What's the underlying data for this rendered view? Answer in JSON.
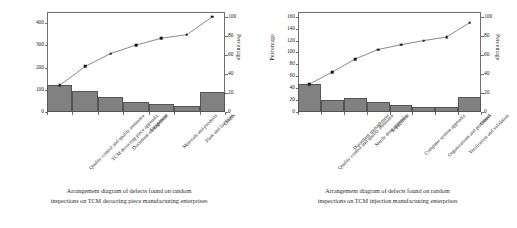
{
  "figure": {
    "panels": [
      {
        "id": "tcm-decocting-piece",
        "caption_line1": "Arrangement diagram of defects found on random",
        "caption_line2": "inspections on TCM decocting piece manufacturing enterprises",
        "right_axis_title": "Percentage",
        "chart_data": {
          "type": "bar",
          "title": "",
          "subtitle": "",
          "xlabel": "",
          "ylabel": "",
          "y2label": "Percentage",
          "grid": false,
          "legend": "none",
          "categories": [
            "Quality control and quality assurance",
            "TCM decocting piece appendix",
            "Document management",
            "Equipment",
            "Materials and products",
            "Plant and facilities",
            "Others"
          ],
          "series": [
            {
              "name": "Defect count",
              "type": "bar",
              "values": [
                120,
                95,
                68,
                45,
                38,
                25,
                88
              ]
            },
            {
              "name": "Cumulative percentage",
              "type": "line",
              "values": [
                120,
                205,
                263,
                301,
                332,
                348,
                428
              ]
            }
          ],
          "ylim": [
            0,
            450
          ],
          "yticks": [
            0,
            100,
            200,
            300,
            400
          ],
          "ytick_labels": [
            "0",
            "100",
            "200",
            "300",
            "400"
          ],
          "y2lim": [
            0,
            105
          ],
          "y2ticks": [
            0,
            20,
            40,
            60,
            80,
            100
          ],
          "y2tick_labels": [
            "0",
            "20",
            "40",
            "60",
            "80",
            "100"
          ],
          "cumulative_percent": [
            28.0,
            47.9,
            61.4,
            70.3,
            77.6,
            81.3,
            100.0
          ]
        }
      },
      {
        "id": "tcm-injection",
        "caption_line1": "Arrangement diagram of defects found on random",
        "caption_line2": "inspections on TCM injection manufacturing enterprises",
        "left_axis_title": "Percentage",
        "right_axis_title": "Percentage",
        "chart_data": {
          "type": "bar",
          "title": "",
          "subtitle": "",
          "xlabel": "",
          "ylabel": "Percentage",
          "y2label": "Percentage",
          "grid": false,
          "legend": "none",
          "categories": [
            "Quality control and quality assurance",
            "Document management",
            "Sterile drug appendix",
            "Equipment",
            "Computer system appendix",
            "Organizations and personnel",
            "Verification and validation",
            "Others"
          ],
          "series": [
            {
              "name": "Defect count",
              "type": "bar",
              "values": [
                47,
                21,
                23,
                17,
                11,
                9,
                9,
                26
              ]
            },
            {
              "name": "Cumulative percentage",
              "type": "line",
              "values": [
                47,
                67,
                89,
                105,
                113,
                120,
                126,
                150
              ]
            }
          ],
          "ylim": [
            0,
            168
          ],
          "yticks": [
            0,
            20,
            40,
            60,
            80,
            100,
            120,
            140,
            160
          ],
          "ytick_labels": [
            "0",
            "20",
            "40",
            "60",
            "80",
            "100",
            "120",
            "140",
            "160"
          ],
          "y2lim": [
            0,
            105
          ],
          "y2ticks": [
            0,
            20,
            40,
            60,
            80,
            100
          ],
          "y2tick_labels": [
            "0",
            "20",
            "40",
            "60",
            "80",
            "100"
          ],
          "cumulative_percent": [
            31.3,
            44.7,
            59.3,
            70.0,
            75.3,
            80.0,
            84.0,
            100.0
          ]
        }
      }
    ]
  },
  "colors": {
    "bar_fill": "#818181",
    "bar_stroke": "#555555",
    "line_stroke": "#3a3a3a",
    "marker_fill": "#1a1a1a",
    "frame": "#6e6e6e",
    "text": "#2b2b2b",
    "background": "#ffffff"
  }
}
